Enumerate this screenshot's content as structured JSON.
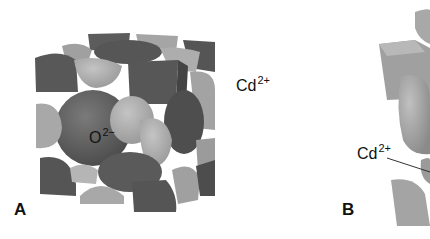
{
  "figure": {
    "panels": [
      {
        "id": "A",
        "label": "A",
        "ion_labels": [
          {
            "ion": "O",
            "charge": "2−"
          },
          {
            "ion": "Cd",
            "charge": "2+"
          }
        ]
      },
      {
        "id": "B",
        "label": "B",
        "ion_labels": [
          {
            "ion": "Cd",
            "charge": "2+"
          }
        ]
      }
    ],
    "colors": {
      "dark_ion": "#5a5a5a",
      "light_ion": "#a9a9a9",
      "background": "#ffffff",
      "text": "#111111"
    }
  }
}
